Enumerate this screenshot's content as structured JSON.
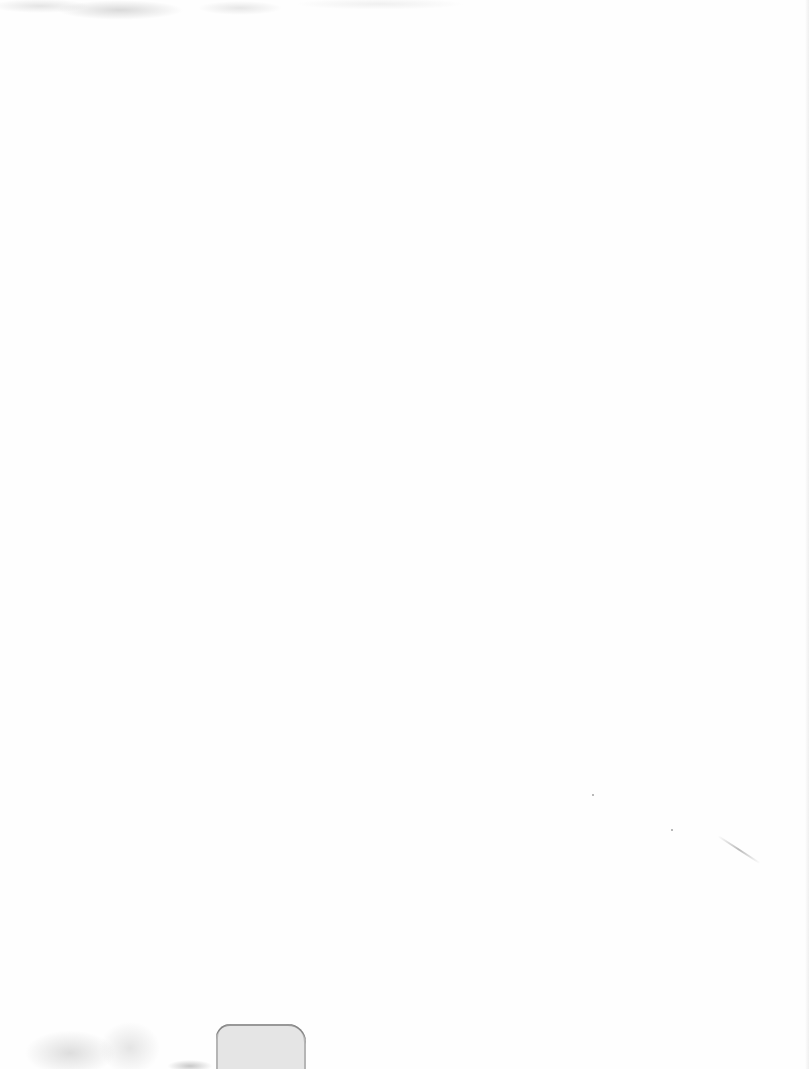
{
  "page": {
    "type": "blank scanned page",
    "content": "",
    "colors": {
      "paper": "#fefefe",
      "stain": "#a0a0a0"
    }
  }
}
